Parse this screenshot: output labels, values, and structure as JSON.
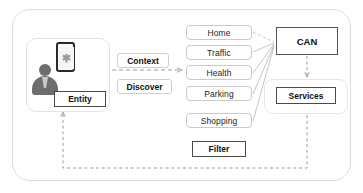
{
  "diagram": {
    "outer_frame": {
      "name": "system-boundary"
    },
    "user_panel": {
      "avatar_label": "user-avatar",
      "phone_label": "smartphone-device",
      "phone_icon": "app-icon",
      "entity": "Entity"
    },
    "flow_labels": {
      "context": "Context",
      "discover": "Discover"
    },
    "context_list": [
      {
        "label": "Home"
      },
      {
        "label": "Traffic"
      },
      {
        "label": "Health"
      },
      {
        "label": "Parking"
      },
      {
        "label": "Shopping"
      }
    ],
    "filter": "Filter",
    "can": "CAN",
    "services": "Services",
    "colors": {
      "outer_border": "#dcdcdc",
      "light_box_border": "#c9c9c9",
      "strong_box_border": "#4a4a4a",
      "connector": "#b8b8b8",
      "text": "#111111",
      "avatar": "#6d6d6d",
      "phone_border": "#2b2b2b"
    }
  }
}
